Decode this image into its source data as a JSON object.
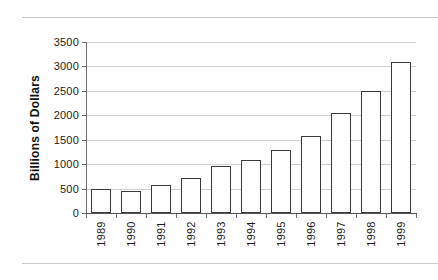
{
  "chart_data": {
    "type": "bar",
    "title": "",
    "xlabel": "",
    "ylabel": "Billions of Dollars",
    "categories": [
      "1989",
      "1990",
      "1991",
      "1992",
      "1993",
      "1994",
      "1995",
      "1996",
      "1997",
      "1998",
      "1999"
    ],
    "values": [
      490,
      460,
      575,
      720,
      970,
      1080,
      1280,
      1580,
      2050,
      2500,
      3100
    ],
    "ylim": [
      0,
      3500
    ],
    "yticks": [
      0,
      500,
      1000,
      1500,
      2000,
      2500,
      3000,
      3500
    ],
    "grid": true,
    "legend": false,
    "colors": {
      "bar_fill": "#ffffff",
      "bar_stroke": "#3a3a3a",
      "gridline": "#cfcfcf",
      "axis": "#6e6e6e",
      "text": "#1a1a1a",
      "page_rule": "#c9c9c9",
      "background": "#ffffff"
    }
  }
}
